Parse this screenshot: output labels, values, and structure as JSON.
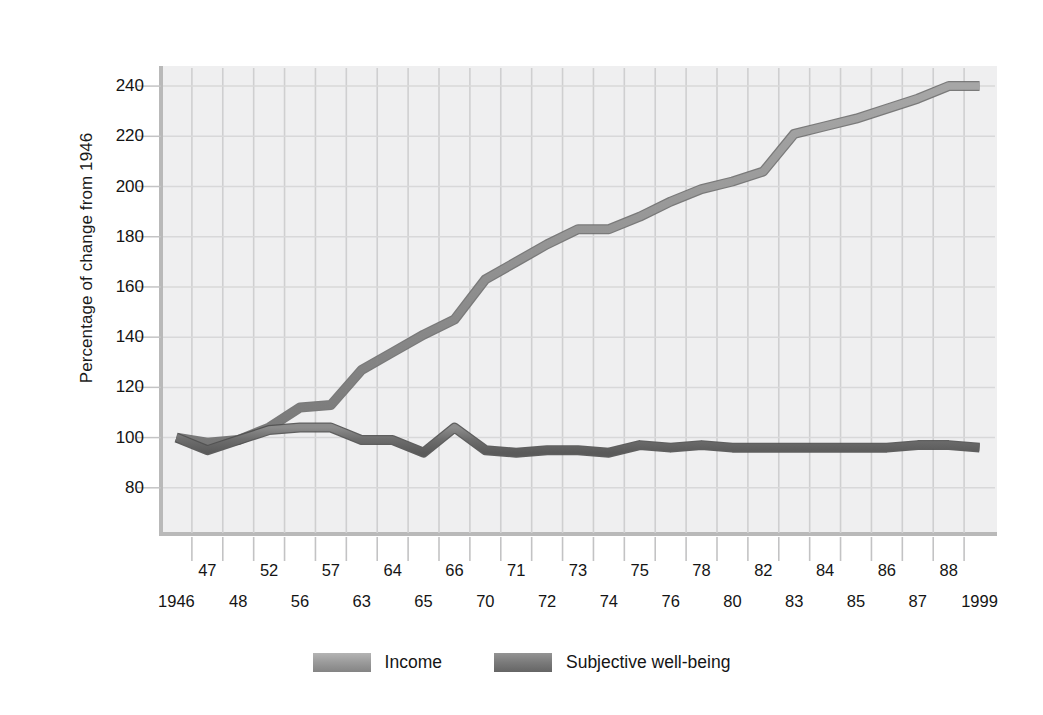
{
  "chart_data": {
    "type": "line",
    "title": "",
    "subtitle": "",
    "xlabel": "",
    "ylabel": "Percentage of change from 1946",
    "ylim": [
      62,
      248
    ],
    "yticks": [
      80,
      100,
      120,
      140,
      160,
      180,
      200,
      220,
      240
    ],
    "grid": true,
    "legend_position": "bottom-center",
    "x_tick_rows": {
      "upper": [
        "47",
        "52",
        "57",
        "64",
        "66",
        "71",
        "73",
        "75",
        "78",
        "82",
        "84",
        "86",
        "88"
      ],
      "lower": [
        "1946",
        "48",
        "56",
        "63",
        "65",
        "70",
        "72",
        "74",
        "76",
        "80",
        "83",
        "85",
        "87",
        "1999"
      ]
    },
    "categories": [
      "1946",
      "47",
      "48",
      "52",
      "56",
      "57",
      "63",
      "64",
      "65",
      "66",
      "70",
      "71",
      "72",
      "73",
      "74",
      "75",
      "76",
      "78",
      "80",
      "82",
      "83",
      "84",
      "85",
      "86",
      "87",
      "88",
      "1999"
    ],
    "series": [
      {
        "name": "Income",
        "color": "#8e8e8e",
        "values": [
          100,
          98,
          99,
          104,
          112,
          113,
          127,
          134,
          141,
          147,
          163,
          170,
          177,
          183,
          183,
          188,
          194,
          199,
          202,
          206,
          221,
          224,
          227,
          231,
          235,
          240,
          240
        ]
      },
      {
        "name": "Subjective well-being",
        "color": "#6f6f6f",
        "values": [
          100,
          95,
          99,
          103,
          104,
          104,
          99,
          99,
          94,
          104,
          95,
          94,
          95,
          95,
          94,
          97,
          96,
          97,
          96,
          96,
          96,
          96,
          96,
          96,
          97,
          97,
          96
        ]
      }
    ],
    "legend": [
      {
        "label": "Income",
        "color": "#9a9a9a"
      },
      {
        "label": "Subjective well-being",
        "color": "#777777"
      }
    ]
  },
  "axis": {
    "y_title": "Percentage of change from 1946"
  }
}
